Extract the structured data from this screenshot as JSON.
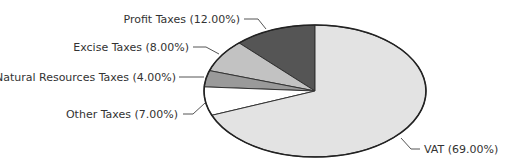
{
  "chart_data": {
    "type": "pie",
    "title": "",
    "start_angle_deg": 90,
    "direction": "counterclockwise",
    "categories": [
      "Profit Taxes",
      "Excise Taxes",
      "Natural Resources Taxes",
      "Other Taxes",
      "VAT"
    ],
    "values": [
      12.0,
      8.0,
      4.0,
      7.0,
      69.0
    ],
    "unit": "%",
    "labels": [
      "Profit Taxes (12.00%)",
      "Excise Taxes (8.00%)",
      "Natural Resources Taxes (4.00%)",
      "Other Taxes (7.00%)",
      "VAT (69.00%)"
    ],
    "colors": [
      "#555555",
      "#c2c2c2",
      "#9a9a9a",
      "#ffffff",
      "#e3e3e3"
    ],
    "legend": "none (leader-line labels)"
  }
}
